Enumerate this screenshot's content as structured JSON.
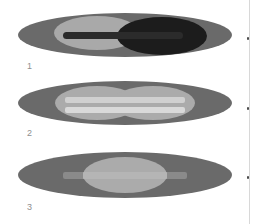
{
  "figure": {
    "background_color": "#ffffff",
    "width": 253,
    "height": 224,
    "panels": [
      {
        "label": "1",
        "label_position": {
          "x": 27,
          "y": 62
        },
        "description": "Large gray ellipse containing a light-gray ellipse on the left and a very dark ellipse on the right, crossed by a dark rounded bar",
        "outer_ellipse": {
          "name": "outer-ellipse",
          "cx": 125,
          "cy": 35,
          "rx": 107,
          "ry": 22,
          "color": "#6a6a6a"
        },
        "shapes": [
          {
            "name": "light-lobe-left",
            "type": "ellipse",
            "cx": 97,
            "cy": 33,
            "rx": 43,
            "ry": 17,
            "color": "#a9a9a9"
          },
          {
            "name": "dark-lobe-right",
            "type": "ellipse",
            "cx": 162,
            "cy": 36,
            "rx": 45,
            "ry": 19,
            "color": "#1c1c1c"
          },
          {
            "name": "dark-spindle-bar",
            "type": "bar",
            "x": 63,
            "y": 32,
            "w": 120,
            "h": 7,
            "color": "#2b2b2b"
          }
        ]
      },
      {
        "label": "2",
        "label_position": {
          "x": 27,
          "y": 129
        },
        "description": "Large gray ellipse containing two overlapping light-gray lobes forming a figure-eight, crossed by two bright horizontal bars",
        "outer_ellipse": {
          "name": "outer-ellipse",
          "cx": 125,
          "cy": 103,
          "rx": 107,
          "ry": 22,
          "color": "#6a6a6a"
        },
        "shapes": [
          {
            "name": "light-lobe-left",
            "type": "ellipse",
            "cx": 97,
            "cy": 103,
            "rx": 42,
            "ry": 17,
            "color": "#ababab"
          },
          {
            "name": "light-lobe-right",
            "type": "ellipse",
            "cx": 153,
            "cy": 103,
            "rx": 42,
            "ry": 17,
            "color": "#ababab"
          },
          {
            "name": "bright-bar-upper",
            "type": "bar",
            "x": 65,
            "y": 97,
            "w": 120,
            "h": 6,
            "color": "#d0d0d0"
          },
          {
            "name": "bright-bar-lower",
            "type": "bar",
            "x": 65,
            "y": 107,
            "w": 120,
            "h": 6,
            "color": "#d9d9d9"
          }
        ]
      },
      {
        "label": "3",
        "label_position": {
          "x": 27,
          "y": 203
        },
        "description": "Large gray ellipse containing a single centered light-gray ellipse, crossed by a lighter horizontal bar extending past it",
        "outer_ellipse": {
          "name": "outer-ellipse",
          "cx": 125,
          "cy": 175,
          "rx": 107,
          "ry": 23,
          "color": "#6a6a6a"
        },
        "shapes": [
          {
            "name": "light-center-ellipse",
            "type": "ellipse",
            "cx": 125,
            "cy": 175,
            "rx": 42,
            "ry": 18,
            "color": "#ababab"
          },
          {
            "name": "light-bar",
            "type": "bar",
            "x": 63,
            "y": 172,
            "w": 124,
            "h": 7,
            "color": "#8a8a8a"
          }
        ]
      }
    ],
    "right_rule": {
      "name": "right-edge-rule",
      "color": "#d8d8d8",
      "tick_color": "#4a4a4a",
      "tick_positions_y": [
        37,
        107,
        176
      ]
    },
    "colors": {
      "outer_gray": "#6a6a6a",
      "light_gray": "#ababab",
      "bright_gray": "#d6d6d6",
      "dark": "#1c1c1c",
      "bar_dark": "#2b2b2b",
      "label_gray": "#8f8f8f",
      "background": "#ffffff"
    }
  }
}
